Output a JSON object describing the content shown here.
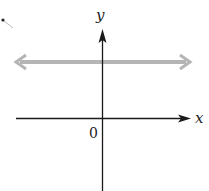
{
  "diagram": {
    "type": "coordinate-plane",
    "axes": {
      "x_label": "x",
      "y_label": "y",
      "origin_label": "0"
    },
    "line": {
      "kind": "horizontal",
      "position": "above x-axis",
      "color": "#b5b5b5",
      "arrows": "both ends"
    },
    "colors": {
      "axis": "#1a1a1a",
      "line": "#b5b5b5",
      "background": "#ffffff"
    }
  }
}
